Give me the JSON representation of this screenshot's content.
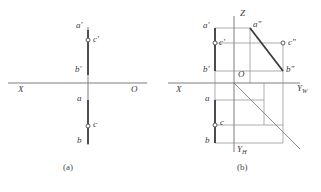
{
  "figure": {
    "background": "#ffffff",
    "line_color": "#6e6e6e",
    "heavy_line_color": "#3c3c3c",
    "label_color": "#3a3a3a",
    "panels": [
      {
        "id": "a",
        "caption": "(a)",
        "caption_pos": [
          70,
          166
        ],
        "axis": {
          "x_axis_label": "X",
          "x_axis_label_pos": [
            18,
            90
          ],
          "origin_label": "O",
          "origin_label_pos": [
            131,
            90
          ],
          "x_axis_line": [
            8,
            83,
            147,
            83
          ]
        },
        "vertical_line": [
          88,
          27,
          88,
          145
        ],
        "points": [
          {
            "name": "a'",
            "label": "a'",
            "label_pos": [
              76,
              26
            ],
            "marker": false,
            "px": 88,
            "py": 31
          },
          {
            "name": "c'",
            "label": "c'",
            "label_pos": [
              95,
              38
            ],
            "marker": true,
            "px": 88,
            "py": 40
          },
          {
            "name": "b'",
            "label": "b'",
            "label_pos": [
              76,
              70
            ],
            "marker": false,
            "px": 88,
            "py": 74
          },
          {
            "name": "a",
            "label": "a",
            "label_pos": [
              77,
              98
            ],
            "marker": false,
            "px": 88,
            "py": 100
          },
          {
            "name": "c",
            "label": "c",
            "label_pos": [
              95,
              124
            ],
            "marker": true,
            "px": 88,
            "py": 126
          },
          {
            "name": "b",
            "label": "b",
            "label_pos": [
              78,
              140
            ],
            "marker": false,
            "px": 88,
            "py": 143
          }
        ]
      },
      {
        "id": "b",
        "caption": "(b)",
        "caption_pos": [
          243,
          166
        ],
        "axis": {
          "x_axis_label": "X",
          "x_axis_label_pos": [
            176,
            90
          ],
          "origin_label": "O",
          "origin_label_pos": [
            237,
            72
          ],
          "z_axis_label": "Z",
          "z_axis_label_pos": [
            242,
            11
          ],
          "yw_axis_label": "Y",
          "yw_axis_subscript": "W",
          "yw_axis_label_pos": [
            297,
            86
          ],
          "yh_axis_label": "Y",
          "yh_axis_subscript": "H",
          "yh_axis_label_pos": [
            239,
            147
          ],
          "x_axis_line": [
            168,
            83,
            300,
            83
          ],
          "z_axis_line": [
            234,
            18,
            234,
            83
          ],
          "yh_axis_line": [
            234,
            83,
            234,
            150
          ],
          "yw_axis_line": [
            234,
            83,
            296,
            83
          ],
          "bisector_line": [
            234,
            83,
            298,
            148
          ]
        },
        "points": [
          {
            "name": "a'",
            "label": "a'",
            "label_pos": [
              203,
              25
            ],
            "marker": false,
            "px": 215,
            "py": 28
          },
          {
            "name": "a''",
            "label": "a\"",
            "label_pos": [
              254,
              24
            ],
            "marker": false,
            "px": 250,
            "py": 28
          },
          {
            "name": "c'",
            "label": "c'",
            "label_pos": [
              218,
              40
            ],
            "marker": true,
            "px": 215,
            "py": 43
          },
          {
            "name": "c''",
            "label": "c\"",
            "label_pos": [
              289,
              41
            ],
            "marker": true,
            "px": 283,
            "py": 43
          },
          {
            "name": "b'",
            "label": "b'",
            "label_pos": [
              203,
              68
            ],
            "marker": false,
            "px": 215,
            "py": 71
          },
          {
            "name": "b''",
            "label": "b\"",
            "label_pos": [
              287,
              68
            ],
            "marker": false,
            "px": 283,
            "py": 71
          },
          {
            "name": "a",
            "label": "a",
            "label_pos": [
              205,
              97
            ],
            "marker": false,
            "px": 215,
            "py": 100
          },
          {
            "name": "c",
            "label": "c",
            "label_pos": [
              221,
              122
            ],
            "marker": true,
            "px": 215,
            "py": 125
          },
          {
            "name": "b",
            "label": "b",
            "label_pos": [
              205,
              139
            ],
            "marker": false,
            "px": 215,
            "py": 143
          }
        ],
        "heavy_segments": [
          {
            "name": "ab-frontal-projection",
            "from": [
              215,
              28
            ],
            "to": [
              215,
              71
            ]
          },
          {
            "name": "ab-profile-projection",
            "from": [
              250,
              28
            ],
            "to": [
              283,
              71
            ]
          },
          {
            "name": "ab-horizontal-projection",
            "from": [
              215,
              100
            ],
            "to": [
              215,
              143
            ]
          }
        ]
      }
    ]
  }
}
